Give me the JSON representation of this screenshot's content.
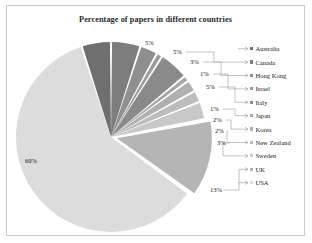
{
  "figure": {
    "border_color": "#c9c9c9",
    "background": "#ffffff"
  },
  "chart_data": {
    "type": "pie",
    "title": "Percentage of papers in different countries",
    "xlabel": "",
    "ylabel": "",
    "legend_position": "right",
    "grid": false,
    "categories": [
      "Australia",
      "Canada",
      "Hong Kong",
      "Israel",
      "Italy",
      "Japan",
      "Korea",
      "New Zealand",
      "Sweden",
      "UK",
      "USA"
    ],
    "values": [
      5,
      5,
      3,
      1,
      5,
      1,
      2,
      2,
      3,
      13,
      60
    ],
    "value_labels": [
      "5%",
      "5%",
      "3%",
      "1%",
      "5%",
      "1%",
      "2%",
      "2%",
      "3%",
      "13%",
      "60%"
    ],
    "colors": [
      "#6f6f6f",
      "#7d7d7d",
      "#8f8f8f",
      "#9a9a9a",
      "#8a8a8a",
      "#a5a5a5",
      "#b0b0b0",
      "#bdbdbd",
      "#c8c8c8",
      "#b5b5b5",
      "#dcdcdc"
    ],
    "exploded": [
      "UK"
    ],
    "slice_gap_color": "#ffffff",
    "start_angle_deg": -18
  },
  "labels": {
    "australia": "5%",
    "canada": "5%",
    "hong_kong": "3%",
    "israel": "1%",
    "italy": "5%",
    "japan": "1%",
    "korea": "2%",
    "new_zealand": "2%",
    "sweden": "3%",
    "uk": "13%",
    "usa": "60%"
  },
  "legend": {
    "items": [
      {
        "label": "Australia",
        "color": "#6f6f6f"
      },
      {
        "label": "Canada",
        "color": "#7d7d7d"
      },
      {
        "label": "Hong Kong",
        "color": "#8f8f8f"
      },
      {
        "label": "Israel",
        "color": "#9a9a9a"
      },
      {
        "label": "Italy",
        "color": "#8a8a8a"
      },
      {
        "label": "Japan",
        "color": "#a5a5a5"
      },
      {
        "label": "Korea",
        "color": "#b0b0b0"
      },
      {
        "label": "New Zealand",
        "color": "#bdbdbd"
      },
      {
        "label": "Sweden",
        "color": "#c8c8c8"
      },
      {
        "label": "UK",
        "color": "#b5b5b5"
      },
      {
        "label": "USA",
        "color": "#dcdcdc"
      }
    ]
  }
}
